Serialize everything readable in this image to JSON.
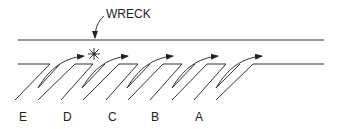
{
  "diagram": {
    "callout": {
      "text": "WRECK"
    },
    "labels": [
      {
        "id": "E",
        "text": "E",
        "x": 23
      },
      {
        "id": "D",
        "text": "D",
        "x": 67
      },
      {
        "id": "C",
        "text": "C",
        "x": 112
      },
      {
        "id": "B",
        "text": "B",
        "x": 155
      },
      {
        "id": "A",
        "text": "A",
        "x": 199
      }
    ],
    "colors": {
      "stroke": "#333333",
      "background": "#ffffff"
    }
  }
}
